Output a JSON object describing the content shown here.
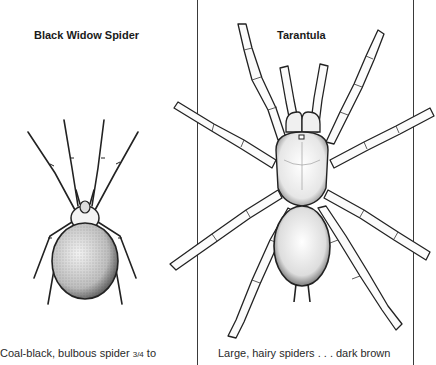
{
  "panels": [
    {
      "title": "Black Widow Spider",
      "caption": {
        "text_before": "Coal-black, bulbous spider ",
        "fraction": "3/4",
        "text_after": " to"
      },
      "illustration": "black-widow-spider-drawing"
    },
    {
      "title": "Tarantula",
      "caption": {
        "text": "Large, hairy spiders . . . dark brown"
      },
      "illustration": "tarantula-drawing"
    }
  ],
  "colors": {
    "background": "#ffffff",
    "ink": "#1c1c1c",
    "rule": "#3a3a3a"
  }
}
